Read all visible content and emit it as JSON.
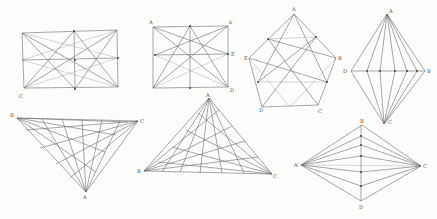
{
  "figures": [
    {
      "name": "rectangle-star",
      "labels": [
        "C"
      ]
    },
    {
      "name": "square-star",
      "labels": [
        "A",
        "b",
        "E",
        "D"
      ]
    },
    {
      "name": "pentagon-star",
      "labels": [
        "A",
        "B",
        "C",
        "D",
        "E"
      ]
    },
    {
      "name": "rhombus-fan-vertical",
      "labels": [
        "A",
        "B",
        "C",
        "D"
      ]
    },
    {
      "name": "inverted-triangle-weave",
      "labels": [
        "B",
        "C",
        "A"
      ]
    },
    {
      "name": "triangle-weave",
      "labels": [
        "A",
        "B",
        "C"
      ]
    },
    {
      "name": "rhombus-fan-horizontal",
      "labels": [
        "A",
        "B",
        "C",
        "D"
      ]
    }
  ]
}
